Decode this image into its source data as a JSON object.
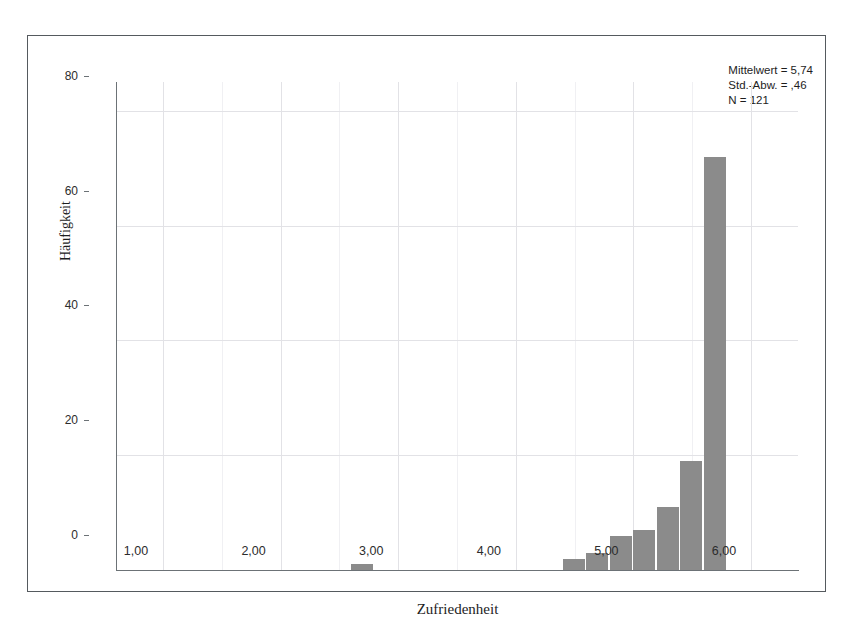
{
  "figure": {
    "background_color": "#ffffff",
    "frame_color": "#555a5e",
    "bar_color": "#8b8b8b",
    "grid_color": "#e2e2e6"
  },
  "annotations": {
    "mean_label": "Mittelwert = 5,74",
    "std_label": "Std.-Abw. = ,46",
    "n_label": "N = 121"
  },
  "chart_data": {
    "type": "bar",
    "title": "",
    "subtitle": "",
    "xlabel": "Zufriedenheit",
    "ylabel": "Häufigkeit",
    "xlim": [
      0.6,
      6.4
    ],
    "ylim": [
      0,
      85
    ],
    "grid": true,
    "legend": "none",
    "xticks": [
      1,
      2,
      3,
      4,
      5,
      6
    ],
    "xtick_labels": [
      "1,00",
      "2,00",
      "3,00",
      "4,00",
      "5,00",
      "6,00"
    ],
    "yticks": [
      0,
      20,
      40,
      60,
      80
    ],
    "ytick_labels": [
      "0",
      "20",
      "40",
      "60",
      "80"
    ],
    "bin_width": 0.2,
    "bars": [
      {
        "x_left": 2.6,
        "x_right": 2.8,
        "value": 1
      },
      {
        "x_left": 4.4,
        "x_right": 4.6,
        "value": 2
      },
      {
        "x_left": 4.6,
        "x_right": 4.8,
        "value": 3
      },
      {
        "x_left": 4.8,
        "x_right": 5.0,
        "value": 6
      },
      {
        "x_left": 5.0,
        "x_right": 5.2,
        "value": 7
      },
      {
        "x_left": 5.2,
        "x_right": 5.4,
        "value": 11
      },
      {
        "x_left": 5.4,
        "x_right": 5.6,
        "value": 19
      },
      {
        "x_left": 5.6,
        "x_right": 5.8,
        "value": 72
      }
    ],
    "statistics": {
      "mean": 5.74,
      "std_dev": 0.46,
      "n": 121
    }
  }
}
